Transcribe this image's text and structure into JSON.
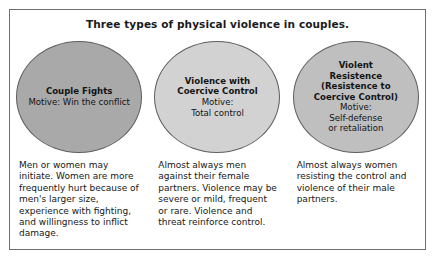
{
  "figure": {
    "title": "Three types of physical violence in couples.",
    "border_color": "#6f6f6f",
    "background_color": "#ffffff",
    "columns": [
      {
        "id": "couple-fights",
        "circle": {
          "fill": "#a9a9a9",
          "stroke": "#5e5e5e",
          "heading": "Couple Fights",
          "body": "Motive: Win the conflict"
        },
        "caption": "Men or women may initiate. Women are more frequently hurt because of men's larger size, experience with fighting, and willingness to inflict damage."
      },
      {
        "id": "violence-with-coercive-control",
        "circle": {
          "fill": "#d2d2d2",
          "stroke": "#5e5e5e",
          "heading": "Violence with Coercive Control",
          "body_line1": "Motive:",
          "body_line2": "Total control"
        },
        "caption": "Almost always men against their female partners. Violence may be severe or mild, frequent or rare. Violence and threat reinforce control."
      },
      {
        "id": "violent-resistence",
        "circle": {
          "fill": "#bfbfbf",
          "stroke": "#5e5e5e",
          "heading_line1": "Violent",
          "heading_line2": "Resistence",
          "heading_line3": "(Resistence to",
          "heading_line4": "Coercive Control)",
          "body_line1": "Motive:",
          "body_line2": "Self-defense",
          "body_line3": "or retaliation"
        },
        "caption": "Almost always women resisting the control and violence of their male partners."
      }
    ]
  }
}
